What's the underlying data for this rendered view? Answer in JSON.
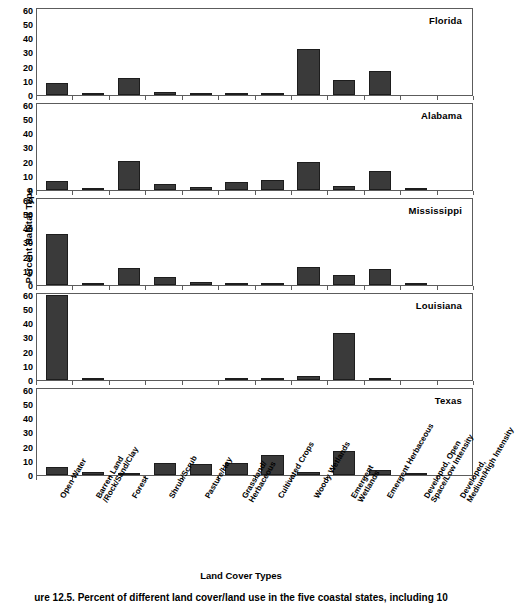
{
  "figure": {
    "caption": "ure 12.5.  Percent of different land cover/land use in the five coastal states, including 10",
    "xlabel": "Land Cover Types",
    "ylabel": "Percent Habitat Type"
  },
  "axis": {
    "yticks": [
      "60",
      "50",
      "40",
      "30",
      "20",
      "10",
      "0"
    ],
    "ymin": 0,
    "ymax": 62
  },
  "chart_data": {
    "type": "bar",
    "title": "Percent of different land cover/land use in the five coastal states",
    "xlabel": "Land Cover Types",
    "ylabel": "Percent Habitat Type",
    "ylim": [
      0,
      62
    ],
    "yticks": [
      0,
      10,
      20,
      30,
      40,
      50,
      60
    ],
    "grid": false,
    "legend": "none",
    "layout": "5 stacked panels, one per state, shared x categories",
    "bar_color": "#3a3a3a",
    "categories": [
      "Open Water",
      "Barren Land /Rock/Sand/Clay",
      "Forest",
      "Shrub/Scrub",
      "Pasture/Hay",
      "Grassland/ Herbaceous",
      "Cultivated Crops",
      "Woody Wetlands",
      "Emergent Wetlands",
      "Emergent Herbaceous",
      "Developed, Open Space/Low Intensity",
      "Developed, Medium/High Intensity"
    ],
    "panels": [
      {
        "name": "Florida",
        "values": [
          8.5,
          1.0,
          12.0,
          2.0,
          1.2,
          0.8,
          1.0,
          33.0,
          10.5,
          17.5,
          0,
          0
        ]
      },
      {
        "name": "Alabama",
        "values": [
          6.5,
          0.8,
          21.0,
          4.2,
          2.0,
          6.0,
          7.5,
          20.0,
          2.6,
          14.0,
          0.8,
          0
        ]
      },
      {
        "name": "Mississippi",
        "values": [
          37.0,
          1.0,
          12.0,
          6.0,
          2.0,
          0.8,
          0.6,
          13.0,
          7.0,
          11.5,
          1.0,
          0
        ]
      },
      {
        "name": "Louisiana",
        "values": [
          61.0,
          1.0,
          0,
          0,
          0,
          0.6,
          1.4,
          2.6,
          34.0,
          1.0,
          0,
          0
        ]
      },
      {
        "name": "Texas",
        "values": [
          6.0,
          2.5,
          1.2,
          9.0,
          8.0,
          9.0,
          14.5,
          2.2,
          17.5,
          3.5,
          0.6,
          0
        ]
      }
    ]
  }
}
